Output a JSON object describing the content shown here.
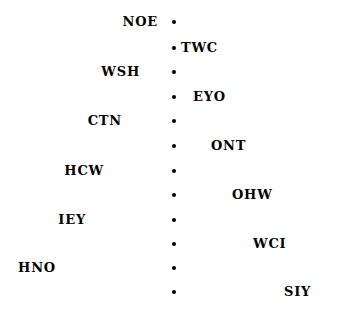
{
  "diagram": {
    "type": "vertical-bullet-timeline",
    "background_color": "#ffffff",
    "text_color": "#000000",
    "bullet_color": "#000000",
    "bullet_count": 12,
    "bullet_column_x": 174,
    "bullet_diameter_px": 4,
    "row_spacing_px": 24.6,
    "nodes": [
      {
        "index": 1,
        "label": "NOE",
        "side": "left",
        "y": 22,
        "label_edge_x": 158
      },
      {
        "index": 2,
        "label": "TWC",
        "side": "right",
        "y": 48,
        "label_edge_x": 181
      },
      {
        "index": 3,
        "label": "WSH",
        "side": "left",
        "y": 72,
        "label_edge_x": 140
      },
      {
        "index": 4,
        "label": "EYO",
        "side": "right",
        "y": 97,
        "label_edge_x": 193
      },
      {
        "index": 5,
        "label": "CTN",
        "side": "left",
        "y": 121,
        "label_edge_x": 122
      },
      {
        "index": 6,
        "label": "ONT",
        "side": "right",
        "y": 146,
        "label_edge_x": 211
      },
      {
        "index": 7,
        "label": "HCW",
        "side": "left",
        "y": 171,
        "label_edge_x": 104
      },
      {
        "index": 8,
        "label": "OHW",
        "side": "right",
        "y": 195,
        "label_edge_x": 232
      },
      {
        "index": 9,
        "label": "IEY",
        "side": "left",
        "y": 220,
        "label_edge_x": 86
      },
      {
        "index": 10,
        "label": "WCI",
        "side": "right",
        "y": 244,
        "label_edge_x": 253
      },
      {
        "index": 11,
        "label": "HNO",
        "side": "left",
        "y": 268,
        "label_edge_x": 56
      },
      {
        "index": 12,
        "label": "SIY",
        "side": "right",
        "y": 292,
        "label_edge_x": 284
      }
    ]
  }
}
